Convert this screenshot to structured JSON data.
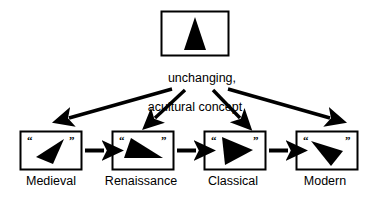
{
  "diagram": {
    "title_caption": {
      "line1": "unchanging,",
      "line2": "acultural concept"
    },
    "top_node": {
      "shape_name": "upright-isosceles-triangle",
      "description": "black upright triangle in a bordered box"
    },
    "eras": [
      {
        "label": "Medieval",
        "shape_name": "left-pointing-dart-triangle",
        "open_quote": "“",
        "close_quote": "”"
      },
      {
        "label": "Renaissance",
        "shape_name": "right-triangle-apex-upper-left",
        "open_quote": "“",
        "close_quote": "”"
      },
      {
        "label": "Classical",
        "shape_name": "right-pointing-triangle",
        "open_quote": "“",
        "close_quote": "”"
      },
      {
        "label": "Modern",
        "shape_name": "down-right-pointing-triangle",
        "open_quote": "“",
        "close_quote": "”"
      }
    ],
    "arrows": {
      "fanout_count": 4,
      "chain_count": 3,
      "fanout_name": "concept-to-era-arrow",
      "chain_name": "era-to-era-arrow"
    },
    "colors": {
      "background": "#ffffff",
      "ink": "#000000",
      "box_border": "#000000"
    }
  }
}
